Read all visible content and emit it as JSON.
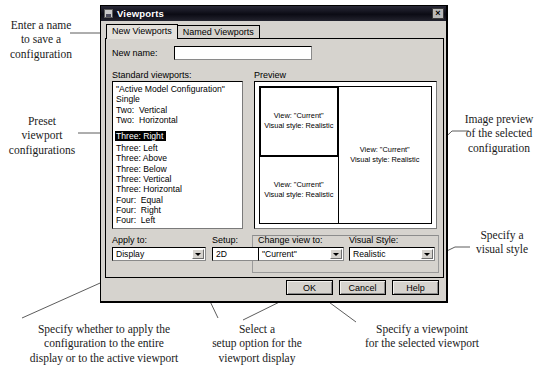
{
  "dialog": {
    "title": "Viewports",
    "title_icon": "window-icon",
    "close_icon": "×",
    "tabs": [
      {
        "label": "New Viewports",
        "active": true
      },
      {
        "label": "Named Viewports",
        "active": false
      }
    ],
    "new_name": {
      "label": "New name:",
      "value": "",
      "placeholder": ""
    },
    "standard_viewports": {
      "label": "Standard viewports:",
      "items": [
        "\"Active Model Configuration\"",
        "Single",
        "Two:  Vertical",
        "Two:  Horizontal",
        "Three: Right",
        "Three: Left",
        "Three: Above",
        "Three: Below",
        "Three: Vertical",
        "Three: Horizontal",
        "Four:  Equal",
        "Four:  Right",
        "Four:  Left"
      ],
      "selected": "Three: Right",
      "selected_index": 4
    },
    "preview": {
      "label": "Preview",
      "panes": [
        {
          "name": "top-left-pane",
          "active": true,
          "text": "View: \"Current\"\nVisual style: Realistic"
        },
        {
          "name": "bottom-left-pane",
          "active": false,
          "text": "View: \"Current\"\nVisual style: Realistic"
        },
        {
          "name": "right-pane",
          "active": false,
          "text": "View: \"Current\"\nVisual style: Realistic"
        }
      ]
    },
    "controls": {
      "apply_to": {
        "label": "Apply to:",
        "value": "Display"
      },
      "setup": {
        "label": "Setup:",
        "value": "2D"
      },
      "change_view_to": {
        "label": "Change view to:",
        "value": "\"Current\""
      },
      "visual_style": {
        "label": "Visual Style:",
        "value": "Realistic"
      }
    },
    "buttons": {
      "ok": "OK",
      "cancel": "Cancel",
      "help": "Help"
    }
  },
  "annotations": {
    "enter_name": "Enter a name\nto save a\nconfiguration",
    "preset_configs": "Preset\nviewport\nconfigurations",
    "image_preview": "Image preview\nof the selected\nconfiguration",
    "visual_style": "Specify a\nvisual style",
    "apply_to": "Specify whether to apply the\nconfiguration to the entire\ndisplay or to the active viewport",
    "setup": "Select a\nsetup option for the\nviewport display",
    "change_view": "Specify a viewpoint\nfor the selected viewport"
  }
}
